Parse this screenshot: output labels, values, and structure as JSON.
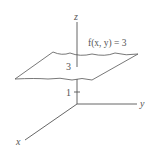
{
  "diagram": {
    "type": "3d-level-surface",
    "axes": {
      "x_label": "x",
      "y_label": "y",
      "z_label": "z"
    },
    "ticks": {
      "z_tick_1": "1",
      "z_tick_3": "3"
    },
    "plane_label": "f(x, y) = 3",
    "colors": {
      "line": "#555555",
      "text": "#555555",
      "background": "#ffffff"
    }
  }
}
